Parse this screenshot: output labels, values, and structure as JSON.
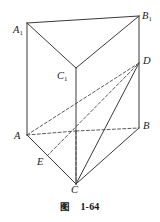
{
  "figure": {
    "kind": "geometry-diagram",
    "caption": {
      "word": "图",
      "number": "1-64"
    },
    "style": {
      "stroke_color": "#3a3a3a",
      "dashed_color": "#5a5a5a",
      "background": "#ffffff",
      "stroke_width": 1,
      "dash_pattern": "3,2.2"
    },
    "vertices": [
      {
        "id": "A1",
        "letter": "A",
        "sub": "1",
        "x": 27,
        "y": 23,
        "label_x": 13,
        "label_y": 25
      },
      {
        "id": "B1",
        "letter": "B",
        "sub": "1",
        "x": 139,
        "y": 16,
        "label_x": 142,
        "label_y": 11
      },
      {
        "id": "C1",
        "letter": "C",
        "sub": "1",
        "x": 76,
        "y": 68,
        "label_x": 57,
        "label_y": 71
      },
      {
        "id": "A",
        "letter": "A",
        "sub": "",
        "x": 27,
        "y": 135,
        "label_x": 14,
        "label_y": 131
      },
      {
        "id": "B",
        "letter": "B",
        "sub": "",
        "x": 139,
        "y": 128,
        "label_x": 143,
        "label_y": 121
      },
      {
        "id": "C",
        "letter": "C",
        "sub": "",
        "x": 76,
        "y": 184,
        "label_x": 71,
        "label_y": 185
      },
      {
        "id": "D",
        "letter": "D",
        "sub": "",
        "x": 139,
        "y": 63,
        "label_x": 143,
        "label_y": 56
      },
      {
        "id": "E",
        "letter": "E",
        "sub": "",
        "x": 47,
        "y": 156,
        "label_x": 37,
        "label_y": 157
      },
      {
        "id": "H",
        "letter": "",
        "sub": "",
        "x": 76,
        "y": 131,
        "label_x": 0,
        "label_y": 0
      }
    ],
    "solid_edges": [
      {
        "name": "edge-A1-B1",
        "from": "A1",
        "to": "B1"
      },
      {
        "name": "edge-A1-C1",
        "from": "A1",
        "to": "C1"
      },
      {
        "name": "edge-B1-C1",
        "from": "B1",
        "to": "C1"
      },
      {
        "name": "edge-A1-A",
        "from": "A1",
        "to": "A"
      },
      {
        "name": "edge-B1-B",
        "from": "B1",
        "to": "B"
      },
      {
        "name": "edge-C1-C",
        "from": "C1",
        "to": "C"
      },
      {
        "name": "edge-A-C",
        "from": "A",
        "to": "C"
      },
      {
        "name": "edge-B-C",
        "from": "B",
        "to": "C"
      },
      {
        "name": "segment-C-D",
        "from": "C",
        "to": "D"
      }
    ],
    "dashed_edges": [
      {
        "name": "hidden-edge-A-H",
        "from": "A",
        "to": "H"
      },
      {
        "name": "hidden-edge-H-B",
        "from": "H",
        "to": "B"
      },
      {
        "name": "hidden-edge-H-C",
        "from": "H",
        "to": "C"
      },
      {
        "name": "segment-A-D",
        "from": "A",
        "to": "D"
      },
      {
        "name": "segment-E-D",
        "from": "E",
        "to": "D"
      }
    ]
  }
}
